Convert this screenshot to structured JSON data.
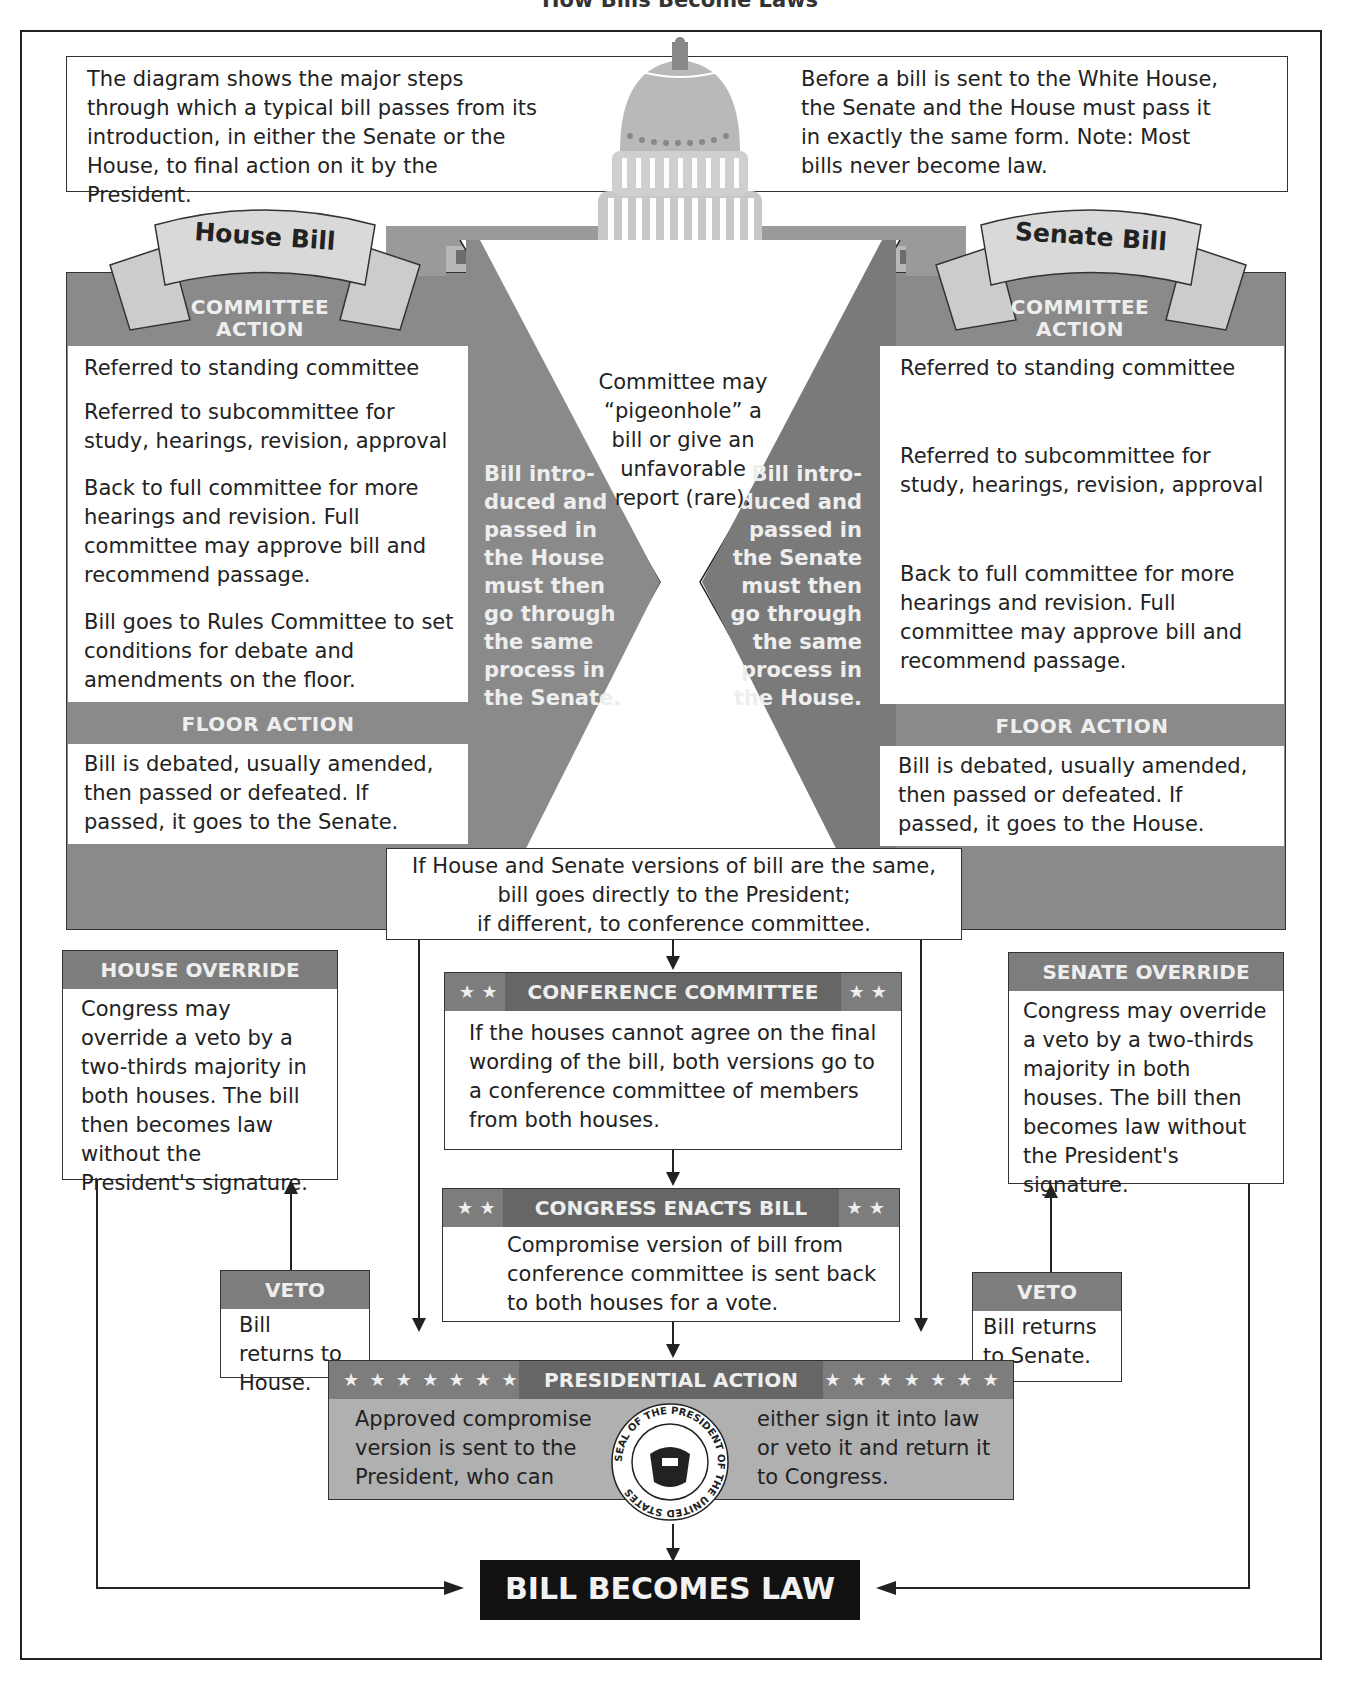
{
  "title": "How Bills Become Laws",
  "intro": {
    "left_text": "The diagram shows the major steps through which a typical bill passes from its introduction, in either the Senate or the House, to final action on it by the President.",
    "right_text": "Before a bill is sent to the White House, the Senate and the House must pass it in exactly the same form. Note: Most bills never become law."
  },
  "house": {
    "banner": "House Bill",
    "committee_header_line1": "COMMITTEE",
    "committee_header_line2": "ACTION",
    "committee_steps": [
      "Referred to standing committee",
      "Referred to subcommittee for study, hearings, revision, approval",
      "Back to full committee for more hearings and revision. Full committee may approve bill and recommend passage.",
      "Bill goes to Rules Committee to set conditions for debate and amendments on the floor."
    ],
    "floor_header": "FLOOR ACTION",
    "floor_text": "Bill is debated, usually amended, then passed or defeated. If passed, it goes to the Senate.",
    "side_note": "Bill intro- duced and passed in the House must then go through the same process in the Senate."
  },
  "senate": {
    "banner": "Senate Bill",
    "committee_header_line1": "COMMITTEE",
    "committee_header_line2": "ACTION",
    "committee_steps": [
      "Referred to standing committee",
      "Referred to subcommittee for study, hearings, revision, approval",
      "Back to full committee for more hearings and revision. Full committee may approve bill and recommend passage."
    ],
    "floor_header": "FLOOR ACTION",
    "floor_text": "Bill is debated, usually amended, then passed or defeated. If passed, it goes to the House.",
    "side_note": "Bill intro- duced and passed in the Senate must then go through the same process in the House."
  },
  "center_note": "Committee may “pigeonhole” a bill or give an unfavorable report (rare).",
  "versions_note": {
    "line1": "If House and Senate versions of bill are the same,",
    "line2": "bill goes directly to the President;",
    "line3": "if different, to conference committee."
  },
  "conference": {
    "header": "CONFERENCE COMMITTEE",
    "stars": "★ ★",
    "text": "If the houses cannot agree on the final wording of the bill, both versions go to a conference committee of members from both houses."
  },
  "enacts": {
    "header": "CONGRESS ENACTS BILL",
    "stars": "★ ★",
    "text": "Compromise version of bill from conference committee is sent back to both houses for a vote."
  },
  "house_override": {
    "header": "HOUSE OVERRIDE",
    "text": "Congress may override a veto by a two-thirds majority in both houses. The bill then becomes law without the President's signature."
  },
  "senate_override": {
    "header": "SENATE OVERRIDE",
    "text": "Congress may override a veto by a two-thirds majority in both houses. The bill then becomes law without the President's signature."
  },
  "house_veto": {
    "header": "VETO",
    "text": "Bill returns to House."
  },
  "senate_veto": {
    "header": "VETO",
    "text": "Bill returns to Senate."
  },
  "presidential": {
    "header": "PRESIDENTIAL ACTION",
    "stars": "★ ★ ★ ★ ★ ★ ★",
    "left_text": "Approved compromise version is sent to the President, who can",
    "right_text": "either sign it into law or veto it and return it to Congress.",
    "seal_text": "SEAL OF THE PRESIDENT OF THE UNITED STATES"
  },
  "final": "BILL BECOMES LAW"
}
